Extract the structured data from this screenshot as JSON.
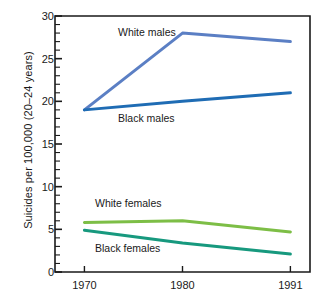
{
  "chart_data": {
    "type": "line",
    "title": "",
    "xlabel": "",
    "ylabel": "Suicides per 100,000 (20–24 years)",
    "x": [
      1970,
      1980,
      1991
    ],
    "xticklabels": [
      "1970",
      "1980",
      "1991"
    ],
    "xlim": [
      1967,
      1993
    ],
    "ylim": [
      0,
      30
    ],
    "yticks": [
      0,
      5,
      10,
      15,
      20,
      25,
      30
    ],
    "yticklabels": [
      "0",
      "5",
      "10",
      "15",
      "20",
      "25",
      "30"
    ],
    "y_minor_tick_step": 1,
    "grid": false,
    "legend": "inline-annotations",
    "series": [
      {
        "name": "White males",
        "label": "White males",
        "color": "#5B7FC4",
        "values": [
          19.0,
          28.0,
          27.0
        ]
      },
      {
        "name": "Black males",
        "label": "Black males",
        "color": "#1F6CB4",
        "values": [
          19.0,
          20.0,
          21.0
        ]
      },
      {
        "name": "White females",
        "label": "White females",
        "color": "#7DBE46",
        "values": [
          5.8,
          6.0,
          4.7
        ]
      },
      {
        "name": "Black females",
        "label": "Black females",
        "color": "#17997E",
        "values": [
          4.9,
          3.4,
          2.1
        ]
      }
    ],
    "annotations": [
      {
        "text": "White males",
        "for_series": "White males"
      },
      {
        "text": "Black males",
        "for_series": "Black males"
      },
      {
        "text": "White females",
        "for_series": "White females"
      },
      {
        "text": "Black females",
        "for_series": "Black females"
      }
    ]
  },
  "axes": {
    "y_title": "Suicides per 100,000 (20–24 years)",
    "y_ticks": [
      "30",
      "25",
      "20",
      "15",
      "10",
      "5",
      "0"
    ],
    "x_ticks": [
      "1970",
      "1980",
      "1991"
    ]
  },
  "labels": {
    "white_males": "White males",
    "black_males": "Black males",
    "white_females": "White females",
    "black_females": "Black females"
  },
  "colors": {
    "white_males": "#5B7FC4",
    "black_males": "#1F6CB4",
    "white_females": "#7DBE46",
    "black_females": "#17997E",
    "axis": "#1a1a1a",
    "background": "#ffffff"
  }
}
